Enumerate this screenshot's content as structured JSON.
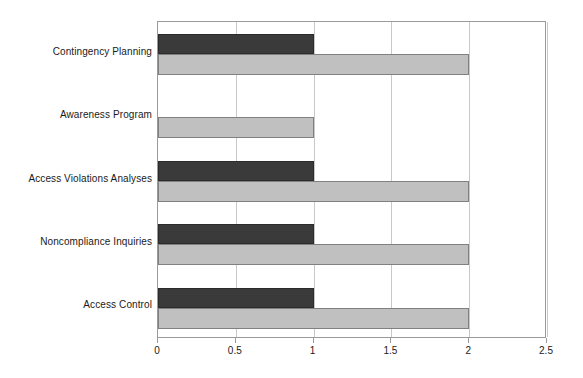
{
  "chart_data": {
    "type": "bar",
    "orientation": "horizontal",
    "title": "",
    "subtitle": "",
    "xlabel": "",
    "ylabel": "",
    "categories": [
      "Contingency Planning",
      "Awareness Program",
      "Access Violations Analyses",
      "Noncompliance Inquiries",
      "Access Control"
    ],
    "category_order_top_to_bottom": [
      "Contingency Planning",
      "Awareness Program",
      "Access Violations Analyses",
      "Noncompliance Inquiries",
      "Access Control"
    ],
    "series": [
      {
        "name": "Series 1",
        "color": "#3a3a3a",
        "values": [
          1,
          0,
          1,
          1,
          1
        ]
      },
      {
        "name": "Series 2",
        "color": "#c0c0c0",
        "values": [
          2,
          1,
          2,
          2,
          2
        ]
      }
    ],
    "xlim": [
      0,
      2.5
    ],
    "x_ticks": [
      0,
      0.5,
      1,
      1.5,
      2,
      2.5
    ],
    "x_tick_labels": [
      "0",
      "0.5",
      "1",
      "1.5",
      "2",
      "2.5"
    ],
    "grid": {
      "vertical": true,
      "horizontal": false,
      "color": "#c8c8c8"
    },
    "legend": {
      "visible": false,
      "position": "none",
      "entries": []
    },
    "axis_color": "#9a9a9a",
    "background_color": "#ffffff",
    "text_color": "#1a1a1a"
  }
}
